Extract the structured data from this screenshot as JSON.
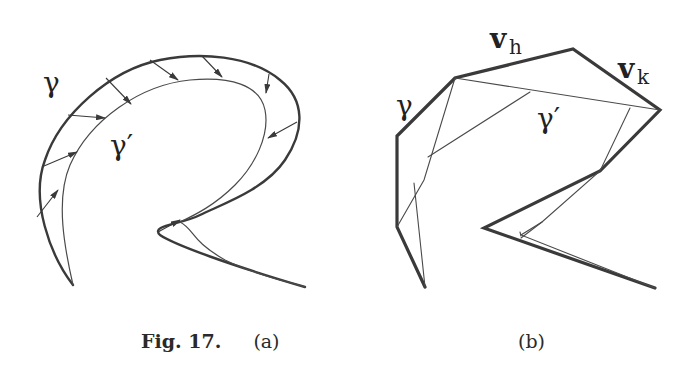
{
  "figure": {
    "number_label": "Fig. 17.",
    "panel_a": {
      "caption": "(a)",
      "labels": {
        "outer_curve": "γ",
        "inner_curve": "γ′"
      }
    },
    "panel_b": {
      "caption": "(b)",
      "labels": {
        "outer_polygon": "γ",
        "inner_polygon": "γ′",
        "vertex_h": "v",
        "vertex_h_sub": "h",
        "vertex_k": "v",
        "vertex_k_sub": "k"
      }
    }
  }
}
